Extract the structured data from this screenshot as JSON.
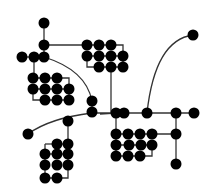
{
  "diagram": {
    "width": 214,
    "height": 193,
    "background": "#ffffff",
    "node_color": "#000000",
    "edge_color": "#333333",
    "node_radius": 5.5,
    "nodes": [
      {
        "id": "n_top",
        "x": 44,
        "y": 23
      },
      {
        "id": "n_j1",
        "x": 44,
        "y": 45
      },
      {
        "id": "n_l1",
        "x": 22,
        "y": 57
      },
      {
        "id": "n_l2",
        "x": 34,
        "y": 57
      },
      {
        "id": "n_l3",
        "x": 44,
        "y": 57
      },
      {
        "id": "g1_a1",
        "x": 87,
        "y": 45
      },
      {
        "id": "g1_a2",
        "x": 99,
        "y": 45
      },
      {
        "id": "g1_a3",
        "x": 111,
        "y": 45
      },
      {
        "id": "g1_b1",
        "x": 87,
        "y": 56
      },
      {
        "id": "g1_b2",
        "x": 99,
        "y": 56
      },
      {
        "id": "g1_b3",
        "x": 111,
        "y": 56
      },
      {
        "id": "g1_b4",
        "x": 123,
        "y": 56
      },
      {
        "id": "g1_c2",
        "x": 99,
        "y": 67
      },
      {
        "id": "g1_c3",
        "x": 111,
        "y": 67
      },
      {
        "id": "g1_c4",
        "x": 123,
        "y": 67
      },
      {
        "id": "g2_a1",
        "x": 33,
        "y": 78
      },
      {
        "id": "g2_a2",
        "x": 45,
        "y": 78
      },
      {
        "id": "g2_a3",
        "x": 57,
        "y": 78
      },
      {
        "id": "g2_b1",
        "x": 33,
        "y": 89
      },
      {
        "id": "g2_b2",
        "x": 45,
        "y": 89
      },
      {
        "id": "g2_b3",
        "x": 57,
        "y": 89
      },
      {
        "id": "g2_b4",
        "x": 69,
        "y": 89
      },
      {
        "id": "g2_c2",
        "x": 45,
        "y": 100
      },
      {
        "id": "g2_c3",
        "x": 57,
        "y": 100
      },
      {
        "id": "g2_c4",
        "x": 69,
        "y": 100
      },
      {
        "id": "n_m1",
        "x": 92,
        "y": 101
      },
      {
        "id": "n_m2",
        "x": 92,
        "y": 112
      },
      {
        "id": "n_tr",
        "x": 193,
        "y": 35
      },
      {
        "id": "h1",
        "x": 116,
        "y": 113
      },
      {
        "id": "h2",
        "x": 124,
        "y": 113
      },
      {
        "id": "h3",
        "x": 147,
        "y": 113
      },
      {
        "id": "h4",
        "x": 176,
        "y": 113
      },
      {
        "id": "h5",
        "x": 194,
        "y": 113
      },
      {
        "id": "n_bl",
        "x": 28,
        "y": 134
      },
      {
        "id": "n_bm",
        "x": 68,
        "y": 121
      },
      {
        "id": "g3_a2",
        "x": 57,
        "y": 144
      },
      {
        "id": "g3_a3",
        "x": 68,
        "y": 144
      },
      {
        "id": "g3_b1",
        "x": 45,
        "y": 154
      },
      {
        "id": "g3_b2",
        "x": 57,
        "y": 154
      },
      {
        "id": "g3_b3",
        "x": 68,
        "y": 154
      },
      {
        "id": "g3_c1",
        "x": 45,
        "y": 165
      },
      {
        "id": "g3_c2",
        "x": 57,
        "y": 165
      },
      {
        "id": "g3_c3",
        "x": 68,
        "y": 165
      },
      {
        "id": "g3_d1",
        "x": 45,
        "y": 178
      },
      {
        "id": "g3_d2",
        "x": 57,
        "y": 178
      },
      {
        "id": "g4_a1",
        "x": 116,
        "y": 134
      },
      {
        "id": "g4_a2",
        "x": 128,
        "y": 134
      },
      {
        "id": "g4_a3",
        "x": 140,
        "y": 134
      },
      {
        "id": "g4_a4",
        "x": 152,
        "y": 134
      },
      {
        "id": "g4_b1",
        "x": 116,
        "y": 145
      },
      {
        "id": "g4_b2",
        "x": 129,
        "y": 145
      },
      {
        "id": "g4_b3",
        "x": 141,
        "y": 145
      },
      {
        "id": "g4_b4",
        "x": 152,
        "y": 145
      },
      {
        "id": "g4_c1",
        "x": 116,
        "y": 156
      },
      {
        "id": "g4_c2",
        "x": 128,
        "y": 156
      },
      {
        "id": "g4_c3",
        "x": 140,
        "y": 156
      },
      {
        "id": "n_r1",
        "x": 176,
        "y": 134
      },
      {
        "id": "n_r2",
        "x": 176,
        "y": 164
      }
    ],
    "edges": [
      {
        "type": "line",
        "points": [
          [
            44,
            23
          ],
          [
            44,
            57
          ]
        ]
      },
      {
        "type": "line",
        "points": [
          [
            22,
            57
          ],
          [
            44,
            57
          ]
        ]
      },
      {
        "type": "line",
        "points": [
          [
            44,
            45
          ],
          [
            87,
            45
          ]
        ]
      },
      {
        "type": "line",
        "points": [
          [
            87,
            45
          ],
          [
            111,
            45
          ],
          [
            123,
            45
          ],
          [
            123,
            67
          ]
        ]
      },
      {
        "type": "line",
        "points": [
          [
            87,
            56
          ],
          [
            123,
            56
          ]
        ]
      },
      {
        "type": "line",
        "points": [
          [
            87,
            56
          ],
          [
            87,
            67
          ],
          [
            123,
            67
          ]
        ]
      },
      {
        "type": "line",
        "points": [
          [
            34,
            57
          ],
          [
            34,
            78
          ]
        ]
      },
      {
        "type": "line",
        "points": [
          [
            33,
            78
          ],
          [
            57,
            78
          ],
          [
            69,
            78
          ],
          [
            69,
            100
          ]
        ]
      },
      {
        "type": "line",
        "points": [
          [
            33,
            89
          ],
          [
            69,
            89
          ]
        ]
      },
      {
        "type": "line",
        "points": [
          [
            33,
            89
          ],
          [
            33,
            100
          ],
          [
            69,
            100
          ]
        ]
      },
      {
        "type": "path",
        "d": "M44 57 Q 86 70 92 101"
      },
      {
        "type": "line",
        "points": [
          [
            92,
            101
          ],
          [
            92,
            112
          ]
        ]
      },
      {
        "type": "path",
        "d": "M193 35 Q 155 40 147 113"
      },
      {
        "type": "line",
        "points": [
          [
            111,
            67
          ],
          [
            111,
            113
          ]
        ]
      },
      {
        "type": "line",
        "points": [
          [
            116,
            113
          ],
          [
            194,
            113
          ]
        ]
      },
      {
        "type": "path",
        "d": "M28 134 Q 50 118 92 113 L 116 113 L 100 114"
      },
      {
        "type": "line",
        "points": [
          [
            68,
            121
          ],
          [
            68,
            144
          ]
        ]
      },
      {
        "type": "line",
        "points": [
          [
            57,
            144
          ],
          [
            68,
            144
          ]
        ]
      },
      {
        "type": "line",
        "points": [
          [
            45,
            144
          ],
          [
            57,
            144
          ]
        ]
      },
      {
        "type": "line",
        "points": [
          [
            45,
            144
          ],
          [
            45,
            178
          ]
        ]
      },
      {
        "type": "line",
        "points": [
          [
            68,
            144
          ],
          [
            68,
            165
          ]
        ]
      },
      {
        "type": "line",
        "points": [
          [
            45,
            154
          ],
          [
            68,
            154
          ]
        ]
      },
      {
        "type": "line",
        "points": [
          [
            68,
            165
          ],
          [
            68,
            178
          ],
          [
            45,
            178
          ]
        ]
      },
      {
        "type": "line",
        "points": [
          [
            116,
            113
          ],
          [
            116,
            156
          ]
        ]
      },
      {
        "type": "line",
        "points": [
          [
            116,
            134
          ],
          [
            176,
            134
          ]
        ]
      },
      {
        "type": "line",
        "points": [
          [
            116,
            145
          ],
          [
            152,
            145
          ],
          [
            152,
            156
          ],
          [
            116,
            156
          ]
        ]
      },
      {
        "type": "line",
        "points": [
          [
            176,
            113
          ],
          [
            176,
            164
          ]
        ]
      }
    ]
  }
}
